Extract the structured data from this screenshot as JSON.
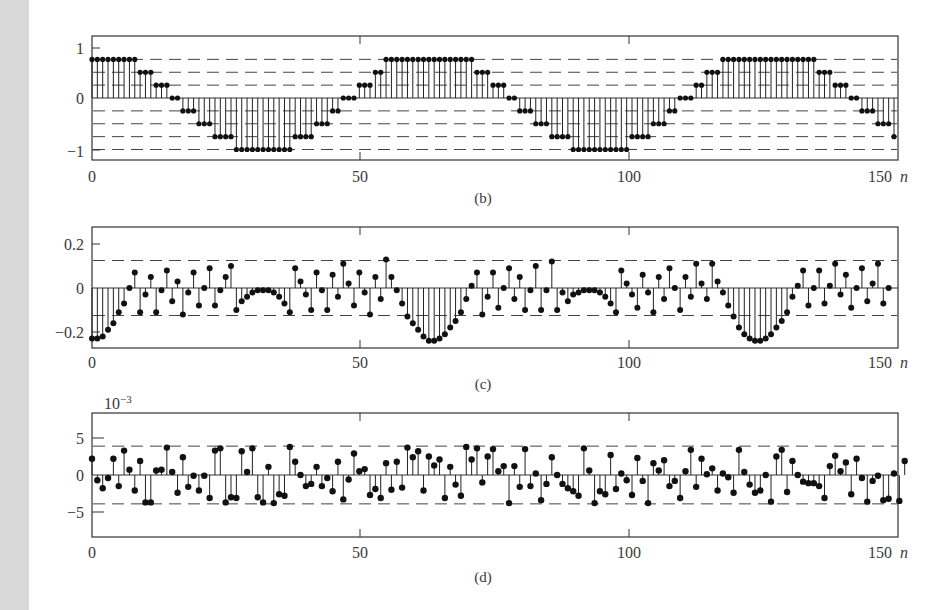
{
  "chart_data": [
    {
      "type": "stem",
      "panel": "b",
      "caption": "(b)",
      "xlabel": "n",
      "ylabel": "",
      "xlim": [
        0,
        151
      ],
      "ylim": [
        -1.2,
        1.2
      ],
      "xticks": [
        0,
        50,
        100,
        150
      ],
      "xtick_labels": [
        "0",
        "50",
        "100",
        "150"
      ],
      "yticks": [
        1,
        0,
        -1
      ],
      "ytick_labels": [
        "1",
        "0",
        "−1"
      ],
      "dashed_levels": [
        0.75,
        0.5,
        0.25,
        -0.25,
        -0.5,
        -0.75,
        -1
      ],
      "x": [
        0,
        1,
        2,
        3,
        4,
        5,
        6,
        7,
        8,
        9,
        10,
        11,
        12,
        13,
        14,
        15,
        16,
        17,
        18,
        19,
        20,
        21,
        22,
        23,
        24,
        25,
        26,
        27,
        28,
        29,
        30,
        31,
        32,
        33,
        34,
        35,
        36,
        37,
        38,
        39,
        40,
        41,
        42,
        43,
        44,
        45,
        46,
        47,
        48,
        49,
        50,
        51,
        52,
        53,
        54,
        55,
        56,
        57,
        58,
        59,
        60,
        61,
        62,
        63,
        64,
        65,
        66,
        67,
        68,
        69,
        70,
        71,
        72,
        73,
        74,
        75,
        76,
        77,
        78,
        79,
        80,
        81,
        82,
        83,
        84,
        85,
        86,
        87,
        88,
        89,
        90,
        91,
        92,
        93,
        94,
        95,
        96,
        97,
        98,
        99,
        100,
        101,
        102,
        103,
        104,
        105,
        106,
        107,
        108,
        109,
        110,
        111,
        112,
        113,
        114,
        115,
        116,
        117,
        118,
        119,
        120,
        121,
        122,
        123,
        124,
        125,
        126,
        127,
        128,
        129,
        130,
        131,
        132,
        133,
        134,
        135,
        136,
        137,
        138,
        139,
        140,
        141,
        142,
        143,
        144,
        145,
        146,
        147,
        148,
        149,
        150
      ],
      "values": [
        0.75,
        0.75,
        0.75,
        0.75,
        0.75,
        0.75,
        0.75,
        0.75,
        0.75,
        0.5,
        0.5,
        0.5,
        0.25,
        0.25,
        0.25,
        0,
        0,
        -0.25,
        -0.25,
        -0.25,
        -0.5,
        -0.5,
        -0.5,
        -0.75,
        -0.75,
        -0.75,
        -0.75,
        -1,
        -1,
        -1,
        -1,
        -1,
        -1,
        -1,
        -1,
        -1,
        -1,
        -1,
        -0.75,
        -0.75,
        -0.75,
        -0.75,
        -0.5,
        -0.5,
        -0.5,
        -0.25,
        -0.25,
        0,
        0,
        0,
        0.25,
        0.25,
        0.25,
        0.5,
        0.5,
        0.75,
        0.75,
        0.75,
        0.75,
        0.75,
        0.75,
        0.75,
        0.75,
        0.75,
        0.75,
        0.75,
        0.75,
        0.75,
        0.75,
        0.75,
        0.75,
        0.75,
        0.5,
        0.5,
        0.5,
        0.25,
        0.25,
        0.25,
        0,
        0,
        -0.25,
        -0.25,
        -0.25,
        -0.5,
        -0.5,
        -0.5,
        -0.75,
        -0.75,
        -0.75,
        -0.75,
        -1,
        -1,
        -1,
        -1,
        -1,
        -1,
        -1,
        -1,
        -1,
        -1,
        -1,
        -0.75,
        -0.75,
        -0.75,
        -0.75,
        -0.5,
        -0.5,
        -0.5,
        -0.25,
        -0.25,
        0,
        0,
        0,
        0.25,
        0.25,
        0.5,
        0.5,
        0.5,
        0.75,
        0.75,
        0.75,
        0.75,
        0.75,
        0.75,
        0.75,
        0.75,
        0.75,
        0.75,
        0.75,
        0.75,
        0.75,
        0.75,
        0.75,
        0.75,
        0.75,
        0.75,
        0.5,
        0.5,
        0.5,
        0.25,
        0.25,
        0.25,
        0,
        0,
        -0.25,
        -0.25,
        -0.25,
        -0.5,
        -0.5,
        -0.5,
        -0.75
      ]
    },
    {
      "type": "stem",
      "panel": "c",
      "caption": "(c)",
      "xlabel": "n",
      "ylabel": "",
      "xlim": [
        0,
        151
      ],
      "ylim": [
        -0.27,
        0.28
      ],
      "xticks": [
        0,
        50,
        100,
        150
      ],
      "xtick_labels": [
        "0",
        "50",
        "100",
        "150"
      ],
      "yticks": [
        0.2,
        0,
        -0.2
      ],
      "ytick_labels": [
        "0.2",
        "0",
        "−0.2"
      ],
      "dashed_levels": [
        0.125,
        -0.125
      ],
      "values": [
        -0.23,
        -0.23,
        -0.22,
        -0.19,
        -0.16,
        -0.11,
        -0.07,
        0.0,
        0.07,
        -0.11,
        -0.03,
        0.05,
        -0.11,
        -0.01,
        0.08,
        -0.06,
        0.03,
        -0.12,
        -0.02,
        0.07,
        -0.08,
        0.0,
        0.09,
        -0.08,
        -0.01,
        0.05,
        0.1,
        -0.1,
        -0.06,
        -0.04,
        -0.02,
        -0.01,
        -0.01,
        -0.01,
        -0.02,
        -0.04,
        -0.07,
        -0.11,
        0.09,
        0.03,
        -0.03,
        -0.1,
        0.07,
        -0.01,
        -0.1,
        0.06,
        -0.04,
        0.11,
        0.02,
        -0.08,
        0.07,
        -0.02,
        -0.12,
        0.05,
        -0.05,
        0.13,
        0.05,
        -0.01,
        -0.07,
        -0.13,
        -0.16,
        -0.19,
        -0.22,
        -0.24,
        -0.24,
        -0.23,
        -0.21,
        -0.18,
        -0.15,
        -0.11,
        -0.05,
        0.01,
        0.07,
        -0.12,
        -0.04,
        0.07,
        -0.09,
        0.0,
        0.09,
        -0.05,
        0.05,
        -0.1,
        -0.01,
        0.1,
        -0.1,
        -0.01,
        0.12,
        -0.1,
        -0.02,
        -0.06,
        -0.03,
        -0.02,
        -0.01,
        -0.01,
        -0.01,
        -0.02,
        -0.04,
        -0.07,
        -0.11,
        0.08,
        0.02,
        -0.03,
        -0.09,
        0.06,
        -0.02,
        -0.11,
        0.05,
        -0.05,
        0.09,
        0.0,
        -0.1,
        0.05,
        -0.04,
        0.11,
        0.02,
        -0.05,
        0.11,
        0.03,
        -0.02,
        -0.08,
        -0.13,
        -0.18,
        -0.21,
        -0.23,
        -0.24,
        -0.24,
        -0.23,
        -0.21,
        -0.18,
        -0.15,
        -0.11,
        -0.04,
        0.01,
        0.08,
        -0.08,
        0.0,
        0.08,
        -0.07,
        0.01,
        0.11,
        -0.03,
        0.06,
        -0.09,
        0.0,
        0.09,
        -0.06,
        0.02,
        0.11,
        -0.07,
        0.0
      ]
    },
    {
      "type": "stem",
      "panel": "d",
      "caption": "(d)",
      "xlabel": "n",
      "ylabel": "",
      "y_scale_label": "10−3",
      "xlim": [
        0,
        151
      ],
      "ylim": [
        -8.5,
        8.5
      ],
      "xticks": [
        0,
        50,
        100,
        150
      ],
      "xtick_labels": [
        "0",
        "50",
        "100",
        "150"
      ],
      "yticks": [
        5,
        0,
        -5
      ],
      "ytick_labels": [
        "5",
        "0",
        "−5"
      ],
      "dashed_levels": [
        3.9,
        -3.9
      ],
      "values": [
        2.2,
        -0.7,
        -1.8,
        -0.4,
        2.2,
        -1.5,
        3.3,
        0.7,
        -2.1,
        1.9,
        -3.7,
        -3.7,
        0.6,
        0.7,
        3.7,
        0.4,
        -2.4,
        2.4,
        -1.6,
        -0.1,
        -2.1,
        -0.1,
        -3.1,
        3.3,
        3.6,
        -3.7,
        -3.0,
        -3.1,
        3.2,
        0.4,
        3.6,
        -3.0,
        -3.7,
        1.1,
        -3.8,
        -2.6,
        -2.8,
        3.8,
        1.8,
        0.0,
        -1.5,
        -1.2,
        1.1,
        -1.5,
        -0.4,
        -2.2,
        1.8,
        -3.3,
        -0.6,
        2.9,
        0.5,
        0.8,
        -2.7,
        -1.9,
        -3.1,
        1.6,
        -2.0,
        1.8,
        -1.7,
        3.7,
        2.4,
        3.2,
        -2.1,
        2.5,
        1.3,
        2.1,
        -3.1,
        1.1,
        -1.3,
        -2.8,
        3.8,
        2.1,
        3.6,
        -1.0,
        2.5,
        3.5,
        0.5,
        1.2,
        -3.8,
        1.2,
        -1.6,
        3.5,
        -1.5,
        0.2,
        -3.4,
        -1.2,
        2.4,
        0.0,
        -1.2,
        -1.8,
        -2.2,
        -2.8,
        3.6,
        0.6,
        -3.8,
        -2.2,
        -2.6,
        2.7,
        -1.9,
        0.2,
        -0.7,
        -2.7,
        2.3,
        -0.8,
        -3.8,
        1.6,
        0.6,
        2.0,
        -1.5,
        -0.8,
        -3.1,
        0.5,
        3.4,
        -1.6,
        2.2,
        0.1,
        0.9,
        -2.1,
        0.2,
        -0.3,
        -2.4,
        3.4,
        0.4,
        -1.3,
        -2.4,
        -2.1,
        0.0,
        -3.6,
        2.5,
        3.4,
        -2.3,
        1.9,
        0.0,
        -0.9,
        -1.1,
        -1.1,
        -1.5,
        -3.1,
        1.2,
        2.6,
        0.5,
        1.7,
        -2.6,
        2.2,
        -0.4,
        -3.6,
        -0.8,
        -0.1,
        -3.4,
        -3.2,
        0.2,
        -3.5,
        1.9
      ]
    }
  ],
  "captions": {
    "b": "(b)",
    "c": "(c)",
    "d": "(d)"
  },
  "axis": {
    "n_label": "n",
    "x_tick_labels": [
      "0",
      "50",
      "100",
      "150"
    ],
    "b_y_labels": [
      "1",
      "0",
      "−1"
    ],
    "c_y_labels": [
      "0.2",
      "0",
      "−0.2"
    ],
    "d_y_labels": [
      "5",
      "0",
      "−5"
    ],
    "d_scale_base": "10",
    "d_scale_exp": "−3"
  }
}
